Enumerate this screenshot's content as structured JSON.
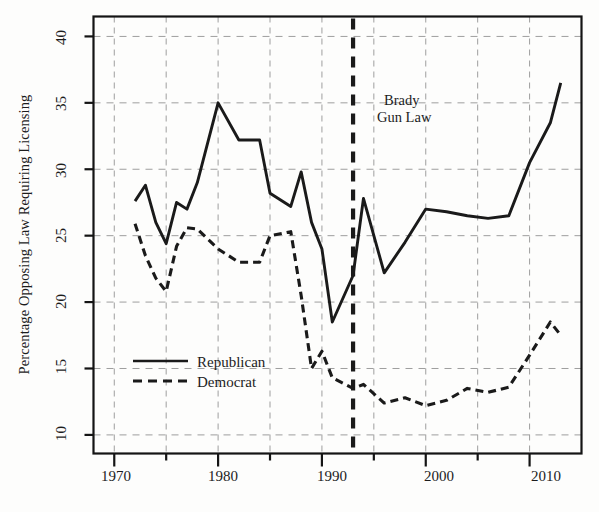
{
  "chart_data": {
    "type": "line",
    "title": "",
    "xlabel": "",
    "ylabel": "Percentage Opposing Law Requiring Licensing",
    "xlim": [
      1968,
      1915
    ],
    "ylim": [
      8.6,
      41.5
    ],
    "xlim_actual": [
      1968,
      1915
    ],
    "x_axis_range": [
      1968.0,
      2015.0
    ],
    "y_axis_range": [
      8.6,
      41.5
    ],
    "grid": true,
    "grid_style": "dashed",
    "legend_position": "center-left inside axes",
    "xticks": [
      1970,
      1980,
      1990,
      2000,
      2010
    ],
    "xtick_labels": [
      "1970",
      "1980",
      "1990",
      "2000",
      "2010"
    ],
    "yticks": [
      10,
      15,
      20,
      25,
      30,
      35,
      40
    ],
    "ytick_labels": [
      "10",
      "15",
      "20",
      "25",
      "30",
      "35",
      "40"
    ],
    "annotations": [
      {
        "name": "brady-gun-law",
        "text_lines": [
          "Brady",
          "Gun Law"
        ],
        "x": 1993,
        "type": "vline",
        "line_style": "dashed-bold"
      }
    ],
    "series": [
      {
        "name": "Republican",
        "style": "solid",
        "color": "#1a1a1a",
        "x": [
          1972,
          1973,
          1974,
          1975,
          1976,
          1977,
          1978,
          1980,
          1982,
          1984,
          1985,
          1987,
          1988,
          1989,
          1990,
          1991,
          1993,
          1994,
          1996,
          1998,
          2000,
          2002,
          2004,
          2006,
          2008,
          2010,
          2012,
          2013
        ],
        "values": [
          27.6,
          28.8,
          26.0,
          24.4,
          27.5,
          27.0,
          29.0,
          35.0,
          32.2,
          32.2,
          28.2,
          27.2,
          29.8,
          26.0,
          24.0,
          18.5,
          22.0,
          27.8,
          22.2,
          24.5,
          27.0,
          26.8,
          26.5,
          26.3,
          26.5,
          30.5,
          33.5,
          36.5
        ]
      },
      {
        "name": "Democrat",
        "style": "dashed",
        "color": "#1a1a1a",
        "x": [
          1972,
          1973,
          1974,
          1975,
          1976,
          1977,
          1978,
          1980,
          1982,
          1984,
          1985,
          1987,
          1988,
          1989,
          1990,
          1991,
          1993,
          1994,
          1996,
          1998,
          2000,
          2002,
          2004,
          2006,
          2008,
          2010,
          2012,
          2013
        ],
        "values": [
          25.9,
          23.5,
          21.8,
          20.8,
          24.2,
          25.6,
          25.5,
          24.0,
          23.0,
          23.0,
          25.0,
          25.3,
          20.5,
          15.0,
          16.3,
          14.3,
          13.5,
          13.8,
          12.4,
          12.8,
          12.2,
          12.6,
          13.5,
          13.2,
          13.6,
          16.0,
          18.5,
          17.5
        ]
      }
    ]
  },
  "legend": {
    "items": [
      {
        "label": "Republican",
        "style": "solid"
      },
      {
        "label": "Democrat",
        "style": "dashed"
      }
    ]
  },
  "axis": {
    "y_title": "Percentage Opposing Law Requiring Licensing",
    "y_tick_0": "10",
    "y_tick_1": "15",
    "y_tick_2": "20",
    "y_tick_3": "25",
    "y_tick_4": "30",
    "y_tick_5": "35",
    "y_tick_6": "40",
    "x_tick_0": "1970",
    "x_tick_1": "1980",
    "x_tick_2": "1990",
    "x_tick_3": "2000",
    "x_tick_4": "2010"
  },
  "annotation": {
    "brady_line1": "Brady",
    "brady_line2": "Gun Law"
  }
}
